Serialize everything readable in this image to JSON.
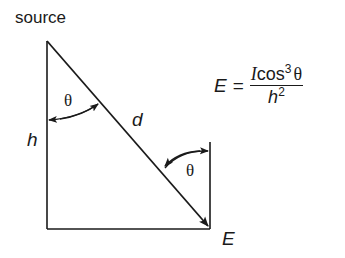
{
  "labels": {
    "source": "source",
    "h": "h",
    "d": "d",
    "theta_top": "θ",
    "theta_right": "θ",
    "E_point": "E"
  },
  "formula": {
    "lhs": "E",
    "equals": "=",
    "numerator_I": "I",
    "numerator_cos": "cos",
    "numerator_exp": "3",
    "numerator_theta": "θ",
    "denominator_h": "h",
    "denominator_exp": "2"
  },
  "geometry": {
    "source_point": [
      47,
      41
    ],
    "bottom_left": [
      47,
      229
    ],
    "E_point": [
      210,
      229
    ],
    "reference_line_top": [
      210,
      142
    ]
  },
  "colors": {
    "line": "#1a1a1a",
    "background": "#ffffff"
  }
}
